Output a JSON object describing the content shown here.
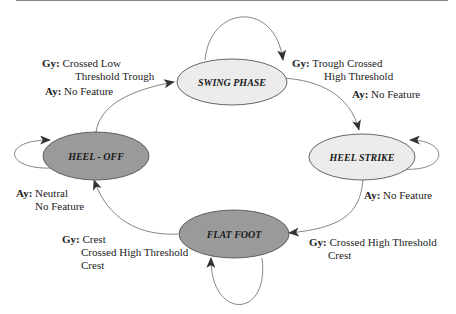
{
  "diagram": {
    "type": "state-machine",
    "colors": {
      "light_state_fill": "#ececec",
      "dark_state_fill": "#9a9a9a",
      "stroke": "#555555",
      "edge": "#666666"
    },
    "states": [
      {
        "id": "swing",
        "label": "SWING PHASE",
        "fill": "light"
      },
      {
        "id": "heel_strike",
        "label": "HEEL STRIKE",
        "fill": "light"
      },
      {
        "id": "flat_foot",
        "label": "FLAT FOOT",
        "fill": "dark"
      },
      {
        "id": "heel_off",
        "label": "HEEL - OFF",
        "fill": "dark"
      }
    ],
    "transitions": {
      "heeloff_to_swing": {
        "gy_key": "Gy:",
        "gy_line1": "Crossed Low",
        "gy_line2": "Threshold Trough",
        "ay_key": "Ay:",
        "ay_line1": "No Feature"
      },
      "swing_to_heelstrike": {
        "gy_key": "Gy:",
        "gy_line1": "Trough Crossed",
        "gy_line2": "High Threshold",
        "ay_key": "Ay:",
        "ay_line1": "No Feature"
      },
      "heelstrike_to_flatfoot": {
        "ay_key": "Ay:",
        "ay_line1": "No Feature",
        "gy_key": "Gy:",
        "gy_line1": "Crossed High Threshold",
        "gy_line2": "Crest"
      },
      "flatfoot_to_heeloff": {
        "ay_key": "Ay:",
        "ay_line1": "Neutral",
        "ay_line2": "No Feature",
        "gy_key": "Gy:",
        "gy_line1": "Crest",
        "gy_line2": "Crossed High Threshold",
        "gy_line3": "Crest"
      }
    }
  }
}
